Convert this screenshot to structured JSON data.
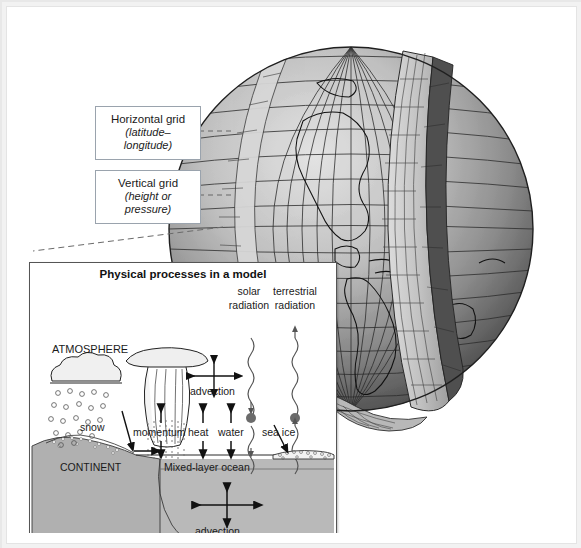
{
  "figure": {
    "type": "diagram"
  },
  "callouts": [
    {
      "name": "horizontal-grid",
      "line1": "Horizontal grid",
      "line2": "(latitude–longitude)"
    },
    {
      "name": "vertical-grid",
      "line1": "Vertical grid",
      "line2": "(height or pressure)"
    }
  ],
  "globe": {
    "description": "Shaded wireframe sphere with latitude-longitude mesh, Americas coastlines, and a wedge cut away exposing vertical model layers",
    "mesh_rows": 22,
    "mesh_cols": 26,
    "continents": [
      "North America",
      "Central America",
      "Caribbean",
      "South America",
      "Greenland",
      "Africa"
    ]
  },
  "inset": {
    "title": "Physical processes in a model",
    "labels": {
      "atmosphere": "ATMOSPHERE",
      "continent": "CONTINENT",
      "ocean": "OCEAN",
      "mixed_layer": "Mixed-layer ocean",
      "snow": "snow",
      "sea_ice": "sea ice",
      "solar_radiation_1": "solar",
      "solar_radiation_2": "radiation",
      "terrestrial_radiation_1": "terrestrial",
      "terrestrial_radiation_2": "radiation",
      "advection_air": "advection",
      "advection_ocean": "advection",
      "momentum": "momentum",
      "heat": "heat",
      "water": "water"
    }
  },
  "colors": {
    "page_background": "#ffffff",
    "outer_frame": "#e8e8e8",
    "callout_border": "#9aa3ad",
    "ink": "#1a1a1a",
    "ocean_fill": "#b9b9b9",
    "continent_fill": "#b0b0b0",
    "globe_dark": "#4a4a4a",
    "globe_light": "#cfcfcf",
    "radiation_dot": "#6b6b6b",
    "leader_dash": "#666666"
  }
}
